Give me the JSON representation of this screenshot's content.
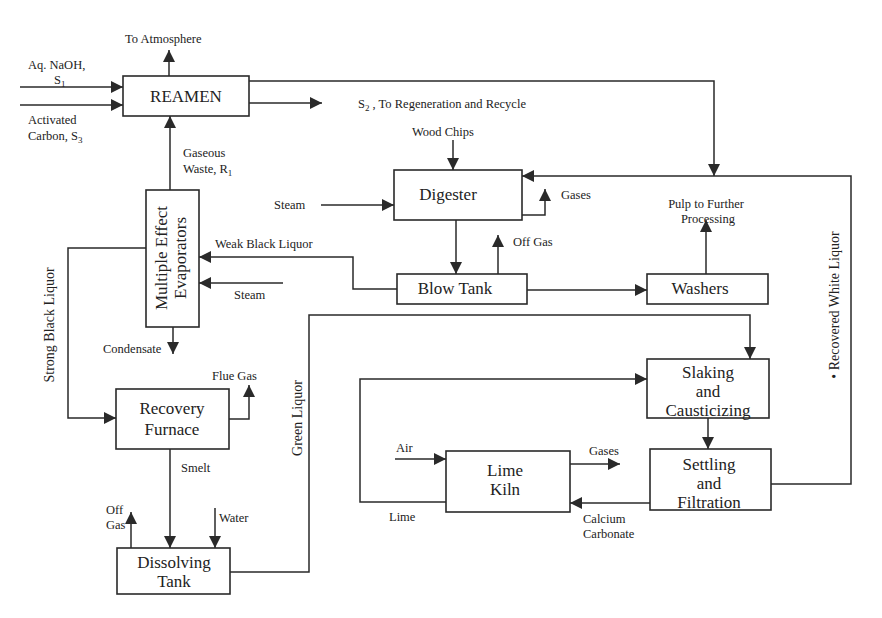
{
  "diagram": {
    "colors": {
      "stroke": "#2a2a2a",
      "text": "#222222",
      "background": "#ffffff"
    },
    "units": {
      "reamen": {
        "label": "REAMEN"
      },
      "evaporators": {
        "line1": "Multiple Effect",
        "line2": "Evaporators"
      },
      "digester": {
        "label": "Digester"
      },
      "blow_tank": {
        "label": "Blow Tank"
      },
      "washers": {
        "label": "Washers"
      },
      "recovery_furnace": {
        "line1": "Recovery",
        "line2": "Furnace"
      },
      "dissolving_tank": {
        "line1": "Dissolving",
        "line2": "Tank"
      },
      "slaking": {
        "line1": "Slaking",
        "line2": "and",
        "line3": "Causticizing"
      },
      "lime_kiln": {
        "line1": "Lime",
        "line2": "Kiln"
      },
      "settling": {
        "line1": "Settling",
        "line2": "and",
        "line3": "Filtration"
      }
    },
    "streams": {
      "to_atmosphere": "To Atmosphere",
      "naoh_line1": "Aq. NaOH,",
      "naoh_line2": "S",
      "naoh_sub": "1",
      "carbon_line1": "Activated",
      "carbon_line2": "Carbon, S",
      "carbon_sub": "3",
      "s2_prefix": "S",
      "s2_sub": "2",
      "s2_text": " , To Regeneration and Recycle",
      "gaseous_line1": "Gaseous",
      "gaseous_line2": "Waste, R",
      "gaseous_sub": "1",
      "wood_chips": "Wood Chips",
      "steam_digester": "Steam",
      "gases_digester": "Gases",
      "off_gas_blow": "Off Gas",
      "pulp_line1": "Pulp to Further",
      "pulp_line2": "Processing",
      "weak_black_liquor": "Weak Black Liquor",
      "steam_evap": "Steam",
      "condensate": "Condensate",
      "strong_black_liquor": "Strong Black Liquor",
      "flue_gas": "Flue Gas",
      "smelt": "Smelt",
      "off_gas_line1": "Off",
      "off_gas_line2": "Gas",
      "water": "Water",
      "green_liquor": "Green Liquor",
      "recovered_white_liquor": "• Recovered White Liquor",
      "air": "Air",
      "gases_kiln": "Gases",
      "lime": "Lime",
      "caco3_line1": "Calcium",
      "caco3_line2": "Carbonate"
    }
  }
}
